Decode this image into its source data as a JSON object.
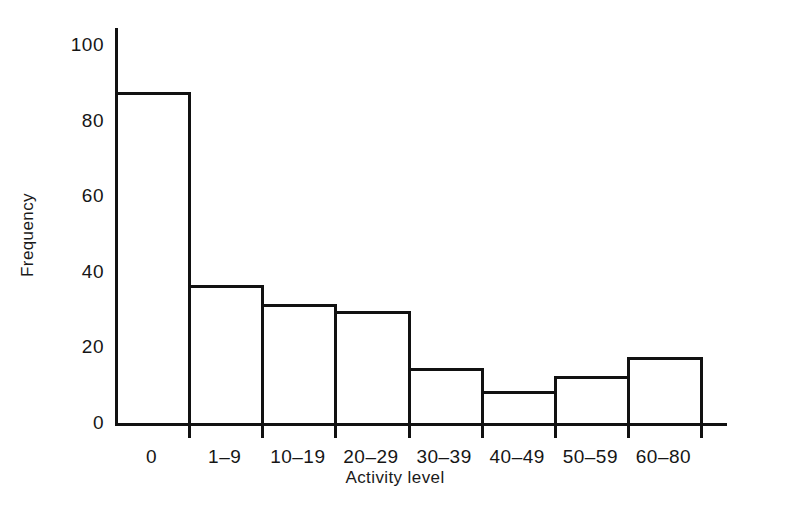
{
  "chart_data": {
    "type": "bar",
    "title": "",
    "subtitle": "",
    "xlabel": "Activity level",
    "ylabel": "Frequency",
    "categories": [
      "0",
      "1–9",
      "10–19",
      "20–29",
      "30–39",
      "40–49",
      "50–59",
      "60–80"
    ],
    "values": [
      87,
      36,
      31,
      29,
      14,
      8,
      12,
      17
    ],
    "ylim": [
      0,
      100
    ],
    "yticks": [
      0,
      20,
      40,
      60,
      80,
      100
    ],
    "ytick_labels": [
      "0",
      "20",
      "40",
      "60",
      "80",
      "100"
    ],
    "grid": false,
    "legend": false,
    "legend_position": "none",
    "bar_style": "histogram-outline",
    "note": "Contiguous histogram bars with black outlines and white fill"
  },
  "style": {
    "line_color": "#111111",
    "text_color": "#161616",
    "background": "#ffffff"
  }
}
